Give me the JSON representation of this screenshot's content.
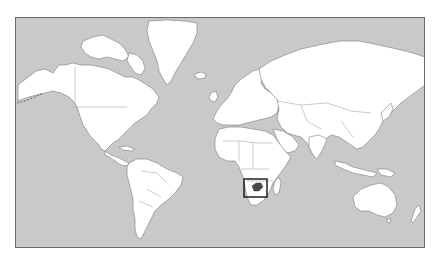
{
  "map": {
    "type": "world-locator-map",
    "projection": "Mercator",
    "colors": {
      "ocean": "#c9c9c9",
      "land": "#ffffff",
      "borders": "#7a7a7a",
      "highlight_fill": "#4a4a4a",
      "highlight_box": "#111111",
      "frame": "#6a6a6a"
    },
    "highlight": {
      "region": "Southern Africa",
      "country": "Zimbabwe",
      "box": {
        "x": 243,
        "y": 178,
        "width": 23,
        "height": 18
      }
    },
    "labels": {
      "highlight_box": "Zimbabwe locator"
    }
  }
}
